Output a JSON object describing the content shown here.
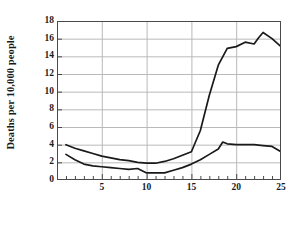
{
  "chart_data": {
    "type": "line",
    "title": "",
    "xlabel": "Age in years",
    "ylabel": "Deaths per 10,000 people",
    "xlim": [
      0,
      25
    ],
    "ylim": [
      0,
      18
    ],
    "xticks": [
      5,
      10,
      15,
      20,
      25
    ],
    "yticks": [
      0,
      2,
      4,
      6,
      8,
      10,
      12,
      14,
      16,
      18
    ],
    "x_minor_tick_step": 1,
    "grid": "horizontal-and-vertical-at-major-ticks",
    "legend": "none",
    "series": [
      {
        "name": "upper-curve",
        "x": [
          1,
          2,
          3,
          4,
          5,
          6,
          7,
          8,
          9,
          10,
          11,
          12,
          13,
          14,
          15,
          16,
          17,
          18,
          19,
          20,
          21,
          22,
          22.5,
          23,
          24,
          25
        ],
        "values": [
          4.0,
          3.6,
          3.3,
          3.0,
          2.7,
          2.5,
          2.3,
          2.2,
          2.0,
          1.9,
          1.9,
          2.1,
          2.4,
          2.8,
          3.2,
          5.6,
          9.6,
          13.0,
          14.9,
          15.1,
          15.6,
          15.4,
          16.1,
          16.7,
          16.0,
          15.1
        ]
      },
      {
        "name": "lower-curve",
        "x": [
          1,
          2,
          3,
          4,
          5,
          6,
          7,
          8,
          9,
          10,
          11,
          12,
          13,
          14,
          15,
          16,
          17,
          18,
          18.5,
          19,
          20,
          21,
          22,
          23,
          24,
          25
        ],
        "values": [
          2.9,
          2.3,
          1.8,
          1.6,
          1.5,
          1.4,
          1.3,
          1.2,
          1.3,
          0.8,
          0.8,
          0.8,
          1.1,
          1.4,
          1.8,
          2.3,
          2.9,
          3.5,
          4.3,
          4.1,
          4.0,
          4.0,
          4.0,
          3.9,
          3.8,
          3.2
        ]
      }
    ]
  },
  "style": {
    "line_color": "#1a1a1a",
    "grid_color": "#b9b9b9",
    "frame_color": "#4a4a4a",
    "background": "#ffffff"
  }
}
